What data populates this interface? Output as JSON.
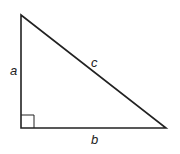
{
  "diagram": {
    "type": "right-triangle",
    "stroke_color": "#222222",
    "labels": {
      "side_a": "a",
      "side_b": "b",
      "hypotenuse_c": "c"
    },
    "right_angle_marker": true
  }
}
